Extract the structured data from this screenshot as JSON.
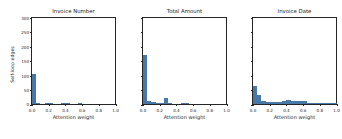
{
  "figure": {
    "shared_ylabel": "Self-loop edges",
    "bar_color": "#4878a8",
    "axis_color": "#262626",
    "background": "#ffffff"
  },
  "chart_data": [
    {
      "type": "bar",
      "title": "Invoice Number",
      "xlabel": "Attention weight",
      "ylabel": "Self-loop edges",
      "xlim": [
        0.0,
        1.0
      ],
      "ylim": [
        0,
        300
      ],
      "grid": false,
      "legend": null,
      "xticks": [
        0.0,
        0.2,
        0.4,
        0.6,
        0.8,
        1.0
      ],
      "xticklabels": [
        "0.0",
        "0.2",
        "0.4",
        "0.6",
        "0.8",
        "1.0"
      ],
      "yticks": [
        0,
        50,
        100,
        150,
        200,
        250,
        300
      ],
      "yticklabels": [
        "0",
        "50",
        "100",
        "150",
        "200",
        "250",
        "300"
      ],
      "bin_width": 0.05,
      "bin_starts": [
        0.0,
        0.05,
        0.1,
        0.15,
        0.2,
        0.25,
        0.3,
        0.35,
        0.4,
        0.45,
        0.5,
        0.55,
        0.6,
        0.65,
        0.7,
        0.75,
        0.8,
        0.85,
        0.9,
        0.95
      ],
      "values": [
        105,
        5,
        0,
        1,
        1,
        0,
        0,
        4,
        4,
        0,
        0,
        1,
        0,
        0,
        0,
        0,
        0,
        0,
        0,
        0
      ]
    },
    {
      "type": "bar",
      "title": "Total Amount",
      "xlabel": "Attention weight",
      "ylabel": "",
      "xlim": [
        0.0,
        1.0
      ],
      "ylim": [
        0,
        300
      ],
      "grid": false,
      "legend": null,
      "xticks": [
        0.0,
        0.2,
        0.4,
        0.6,
        0.8,
        1.0
      ],
      "xticklabels": [
        "0.0",
        "0.2",
        "0.4",
        "0.6",
        "0.8",
        "1.0"
      ],
      "yticks": [
        0,
        50,
        100,
        150,
        200,
        250,
        300
      ],
      "yticklabels": [
        "0",
        "50",
        "100",
        "150",
        "200",
        "250",
        "300"
      ],
      "bin_width": 0.05,
      "bin_starts": [
        0.0,
        0.05,
        0.1,
        0.15,
        0.2,
        0.25,
        0.3,
        0.35,
        0.4,
        0.45,
        0.5,
        0.55,
        0.6,
        0.65,
        0.7,
        0.75,
        0.8,
        0.85,
        0.9,
        0.95
      ],
      "values": [
        170,
        12,
        6,
        4,
        4,
        22,
        1,
        0,
        0,
        1,
        1,
        0,
        0,
        0,
        0,
        0,
        0,
        0,
        0,
        0
      ]
    },
    {
      "type": "bar",
      "title": "Invoice Date",
      "xlabel": "Attention weight",
      "ylabel": "",
      "xlim": [
        0.0,
        1.0
      ],
      "ylim": [
        0,
        300
      ],
      "grid": false,
      "legend": null,
      "xticks": [
        0.0,
        0.2,
        0.4,
        0.6,
        0.8,
        1.0
      ],
      "xticklabels": [
        "0.0",
        "0.2",
        "0.4",
        "0.6",
        "0.8",
        "1.0"
      ],
      "yticks": [
        0,
        50,
        100,
        150,
        200,
        250,
        300
      ],
      "yticklabels": [
        "0",
        "50",
        "100",
        "150",
        "200",
        "250",
        "300"
      ],
      "bin_width": 0.05,
      "bin_starts": [
        0.0,
        0.05,
        0.1,
        0.15,
        0.2,
        0.25,
        0.3,
        0.35,
        0.4,
        0.45,
        0.5,
        0.55,
        0.6,
        0.65,
        0.7,
        0.75,
        0.8,
        0.85,
        0.9,
        0.95
      ],
      "values": [
        62,
        30,
        9,
        6,
        6,
        7,
        8,
        10,
        13,
        11,
        12,
        9,
        9,
        3,
        3,
        3,
        3,
        3,
        2,
        5
      ]
    }
  ]
}
